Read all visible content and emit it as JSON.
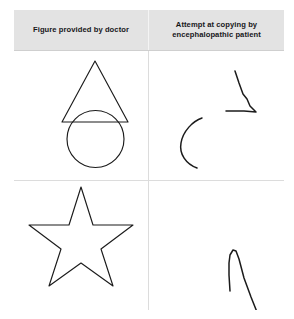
{
  "figure": {
    "columns": [
      {
        "id": "doctor",
        "label": "Figure provided by doctor"
      },
      {
        "id": "patient",
        "label": "Attempt at copying by encephalopathic patient"
      }
    ],
    "rows": [
      {
        "id": "row-triangle-circle",
        "doctor": {
          "name": "triangle-over-circle-figure",
          "description": "Triangle overlapping a circle",
          "shapes": [
            {
              "type": "triangle",
              "points": "81,70 48,131 114,131"
            },
            {
              "type": "circle",
              "cx": 81.5,
              "cy": 148,
              "r": 28.5
            }
          ]
        },
        "patient": {
          "name": "patient-attempt-triangle-circle",
          "description": "Two disconnected strokes: an angular chevron and a short arc",
          "strokes": [
            {
              "type": "angular-chevron",
              "path": "M 86,20 L 95,46 L 100,52 L 107,60 L 78,59 L 77,59"
            },
            {
              "type": "arc",
              "path": "M 52,67 C 43,69 33,80 31,92 C 29,104 36,114 47,117"
            }
          ]
        }
      },
      {
        "id": "row-star",
        "doctor": {
          "name": "five-pointed-star-figure",
          "description": "Five pointed star outline",
          "shapes": [
            {
              "type": "star",
              "points": "67,6 79,44 119,44 87,68 99,105 67,82 35,105 47,68 15,44 55,44"
            }
          ]
        },
        "patient": {
          "name": "patient-attempt-star",
          "description": "Narrow spike stroke plus a wavy line below",
          "strokes": [
            {
              "type": "spike",
              "path": "M 81,110 L 80,82 L 82,72 L 86,69 L 90,75 L 95,96 L 105,124 L 110,136"
            },
            {
              "type": "wavy-line",
              "path": "M 61,166 L 67,163 L 64,157 L 69,152 L 79,148 L 88,141 L 98,137"
            }
          ]
        }
      }
    ]
  },
  "colors": {
    "header_background": "#e3e3e3",
    "header_text": "#17171a",
    "ink": "#1b1b1b",
    "divider": "#dcdcdc",
    "page_background": "#ffffff"
  }
}
